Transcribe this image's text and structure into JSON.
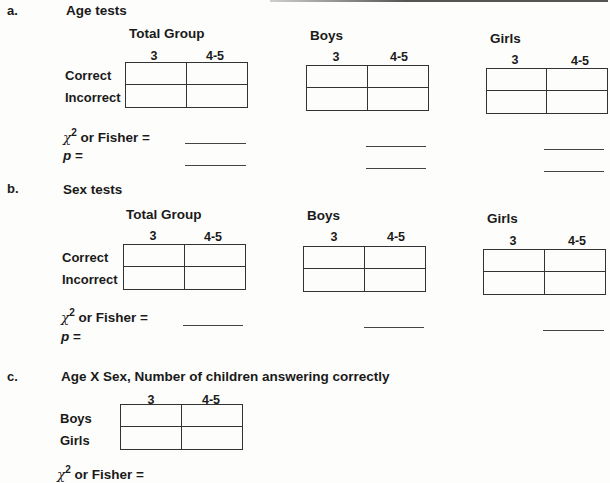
{
  "sections": {
    "a": {
      "letter": "a.",
      "title": "Age tests",
      "groups": [
        {
          "title": "Total Group",
          "cols": [
            "3",
            "4-5"
          ],
          "rows": [
            "Correct",
            "Incorrect"
          ]
        },
        {
          "title": "Boys",
          "cols": [
            "3",
            "4-5"
          ]
        },
        {
          "title": "Girls",
          "cols": [
            "3",
            "4-5"
          ]
        }
      ],
      "stat_label": "or Fisher =",
      "chi_symbol": "χ",
      "chi_sup": "2",
      "p_label": "p",
      "p_eq": " ="
    },
    "b": {
      "letter": "b.",
      "title": "Sex tests",
      "groups": [
        {
          "title": "Total Group",
          "cols": [
            "3",
            "4-5"
          ],
          "rows": [
            "Correct",
            "Incorrect"
          ]
        },
        {
          "title": "Boys",
          "cols": [
            "3",
            "4-5"
          ]
        },
        {
          "title": "Girls",
          "cols": [
            "3",
            "4-5"
          ]
        }
      ],
      "stat_label": "or Fisher =",
      "chi_symbol": "χ",
      "chi_sup": "2",
      "p_label": "p",
      "p_eq": " ="
    },
    "c": {
      "letter": "c.",
      "title": "Age X Sex, Number of children answering correctly",
      "cols": [
        "3",
        "4-5"
      ],
      "rows": [
        "Boys",
        "Girls"
      ],
      "stat_label": "or Fisher =",
      "chi_symbol": "χ",
      "chi_sup": "2"
    }
  }
}
